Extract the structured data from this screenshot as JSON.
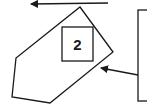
{
  "diagram": {
    "colors": {
      "stroke": "#1a1a1a",
      "background": "#ffffff"
    },
    "box_label": "2",
    "shapes": {
      "pentagon": [
        [
          80,
          7
        ],
        [
          113,
          52
        ],
        [
          50,
          103
        ],
        [
          12,
          97
        ],
        [
          16,
          58
        ]
      ],
      "label_box": {
        "x": 62,
        "y": 27,
        "w": 31,
        "h": 34
      },
      "right_rect": {
        "x": 138,
        "y": 10,
        "w": 20,
        "h": 91
      }
    },
    "arrows": [
      {
        "name": "top-arrow",
        "from": [
          108,
          3
        ],
        "to": [
          31,
          4
        ]
      },
      {
        "name": "pointer-arrow",
        "from": [
          138,
          75
        ],
        "to": [
          101,
          68
        ]
      }
    ]
  }
}
